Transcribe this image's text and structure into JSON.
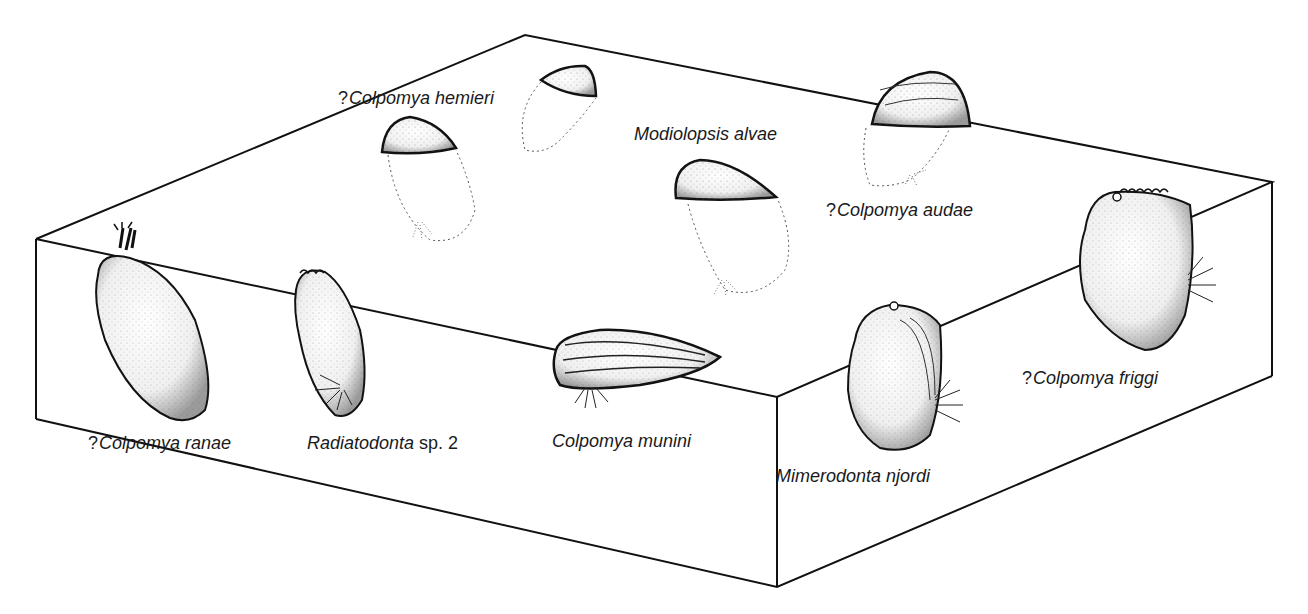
{
  "figure": {
    "type": "block diagram of seafloor with burrowing bivalves",
    "line_color": "#111111",
    "background": "#ffffff"
  },
  "labels": {
    "colpomya_hemieri": {
      "prefix": "?",
      "name": "Colpomya hemieri"
    },
    "modiolopsis_alvae": {
      "prefix": "",
      "name": "Modiolopsis alvae"
    },
    "colpomya_audae": {
      "prefix": "?",
      "name": "Colpomya audae"
    },
    "colpomya_ranae": {
      "prefix": "?",
      "name": "Colpomya ranae"
    },
    "radiatodonta": {
      "prefix": "",
      "name": "Radiatodonta",
      "suffix": " sp. 2"
    },
    "colpomya_munini": {
      "prefix": "",
      "name": "Colpomya munini"
    },
    "mimerodonta_njordi": {
      "prefix": "",
      "name": "Mimerodonta njordi"
    },
    "colpomya_friggi": {
      "prefix": "?",
      "name": "Colpomya friggi"
    }
  }
}
